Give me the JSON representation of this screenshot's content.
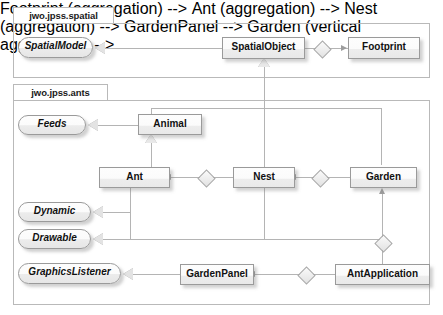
{
  "diagram": {
    "packages": [
      {
        "id": "spatial",
        "label": "jwo.jpss.spatial"
      },
      {
        "id": "ants",
        "label": "jwo.jpss.ants"
      }
    ],
    "interfaces": [
      {
        "id": "spatial-model",
        "label": "SpatialModel"
      },
      {
        "id": "feeds",
        "label": "Feeds"
      },
      {
        "id": "dynamic",
        "label": "Dynamic"
      },
      {
        "id": "drawable",
        "label": "Drawable"
      },
      {
        "id": "graphics-listener",
        "label": "GraphicsListener"
      }
    ],
    "classes": [
      {
        "id": "spatial-object",
        "label": "SpatialObject"
      },
      {
        "id": "footprint",
        "label": "Footprint"
      },
      {
        "id": "animal",
        "label": "Animal"
      },
      {
        "id": "ant",
        "label": "Ant"
      },
      {
        "id": "nest",
        "label": "Nest"
      },
      {
        "id": "garden",
        "label": "Garden"
      },
      {
        "id": "garden-panel",
        "label": "GardenPanel"
      },
      {
        "id": "ant-application",
        "label": "AntApplication"
      }
    ],
    "colors": {
      "background": "#ffffff",
      "box_fill": "#fbfbfb",
      "box_border": "#9a9a9a",
      "connector": "#b4b4b4",
      "text": "#111111",
      "package_border": "#b9b9b9"
    }
  }
}
